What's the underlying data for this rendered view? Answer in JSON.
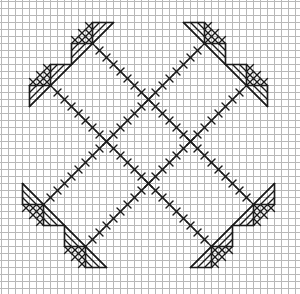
{
  "pattern": {
    "title": "Cross-stitch chart",
    "width": 300,
    "height": 294,
    "cell": 7,
    "grid_offset_x": 1,
    "grid_offset_y": 1,
    "colors": {
      "background": "#ffffff",
      "grid": "#b8b8b8",
      "stitch": "#1a1a1a"
    },
    "lines": [
      {
        "name": "line-a",
        "from": [
          13,
          6
        ],
        "to": [
          36,
          29
        ]
      },
      {
        "name": "line-b",
        "from": [
          7,
          12
        ],
        "to": [
          30,
          35
        ]
      },
      {
        "name": "line-c",
        "from": [
          29,
          6
        ],
        "to": [
          6,
          29
        ]
      },
      {
        "name": "line-d",
        "from": [
          35,
          12
        ],
        "to": [
          12,
          35
        ]
      }
    ],
    "motifs": [
      {
        "name": "motif-top-left-upper",
        "node": [
          13,
          6
        ],
        "dir": [
          -1,
          -1
        ]
      },
      {
        "name": "motif-top-left-lower",
        "node": [
          7,
          12
        ],
        "dir": [
          -1,
          -1
        ]
      },
      {
        "name": "motif-top-right-upper",
        "node": [
          29,
          6
        ],
        "dir": [
          1,
          -1
        ]
      },
      {
        "name": "motif-top-right-lower",
        "node": [
          35,
          12
        ],
        "dir": [
          1,
          -1
        ]
      },
      {
        "name": "motif-bottom-left-upper",
        "node": [
          6,
          29
        ],
        "dir": [
          -1,
          1
        ]
      },
      {
        "name": "motif-bottom-left-lower",
        "node": [
          12,
          35
        ],
        "dir": [
          -1,
          1
        ]
      },
      {
        "name": "motif-bottom-right-upper",
        "node": [
          36,
          29
        ],
        "dir": [
          1,
          1
        ]
      },
      {
        "name": "motif-bottom-right-lower",
        "node": [
          30,
          35
        ],
        "dir": [
          1,
          1
        ]
      }
    ]
  }
}
